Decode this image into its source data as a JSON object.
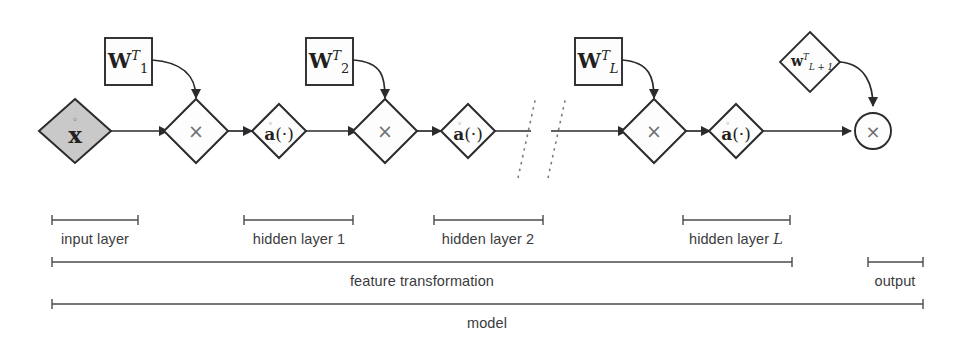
{
  "diagram": {
    "colors": {
      "stroke": "#2b2b2e",
      "input_fill": "#c9c9c9",
      "node_fill": "#fdfdfd",
      "times_glyph": "#6f6f73",
      "bracket": "#4a4a4c",
      "label_text": "#3b3b3d"
    },
    "nodes": {
      "input": {
        "name": "input-vector",
        "label": "x",
        "accent": "ring",
        "shape": "diamond",
        "filled": true
      },
      "multiply1": {
        "name": "multiply-node-1",
        "label": "×",
        "shape": "diamond"
      },
      "activation1": {
        "name": "activation-node-1",
        "label": "a(·)",
        "accent": "ring",
        "shape": "diamond"
      },
      "multiply2": {
        "name": "multiply-node-2",
        "label": "×",
        "shape": "diamond"
      },
      "activation2": {
        "name": "activation-node-2",
        "label": "a(·)",
        "accent": "ring",
        "shape": "diamond"
      },
      "multiplyL": {
        "name": "multiply-node-L",
        "label": "×",
        "shape": "diamond"
      },
      "activationL": {
        "name": "activation-node-L",
        "label": "a(·)",
        "accent": "ring",
        "shape": "diamond"
      },
      "output": {
        "name": "output-multiply-node",
        "label": "×",
        "shape": "circle"
      }
    },
    "weights": [
      {
        "name": "weight-box-1",
        "base": "W",
        "sup": "T",
        "sub": "1",
        "shape": "square"
      },
      {
        "name": "weight-box-2",
        "base": "W",
        "sup": "T",
        "sub": "2",
        "shape": "square"
      },
      {
        "name": "weight-box-L",
        "base": "W",
        "sup": "T",
        "sub": "L",
        "shape": "square"
      },
      {
        "name": "weight-diamond-L-plus-1",
        "base": "w",
        "sup": "T",
        "sub": "L + 1",
        "shape": "diamond"
      }
    ],
    "brackets": [
      {
        "name": "bracket-input-layer",
        "label": "input layer",
        "x1": 52,
        "x2": 138,
        "y": 220,
        "label_x": 95,
        "label_y": 231
      },
      {
        "name": "bracket-hidden-layer-1",
        "label": "hidden layer 1",
        "x1": 244,
        "x2": 353,
        "y": 220,
        "label_x": 299,
        "label_y": 231
      },
      {
        "name": "bracket-hidden-layer-2",
        "label": "hidden layer 2",
        "x1": 434,
        "x2": 543,
        "y": 220,
        "label_x": 488,
        "label_y": 231
      },
      {
        "name": "bracket-hidden-layer-L",
        "label": "hidden layer ",
        "label_italic": "L",
        "x1": 683,
        "x2": 790,
        "y": 220,
        "label_x": 736,
        "label_y": 231
      },
      {
        "name": "bracket-feature-transformation",
        "label": "feature transformation",
        "x1": 52,
        "x2": 792,
        "y": 262,
        "label_x": 422,
        "label_y": 273
      },
      {
        "name": "bracket-output",
        "label": "output",
        "x1": 868,
        "x2": 923,
        "y": 262,
        "label_x": 895,
        "label_y": 273
      },
      {
        "name": "bracket-model",
        "label": "model",
        "x1": 52,
        "x2": 923,
        "y": 304,
        "label_x": 487,
        "label_y": 315
      }
    ],
    "ellipsis": {
      "name": "sequence-break-dots",
      "count": 2
    }
  }
}
